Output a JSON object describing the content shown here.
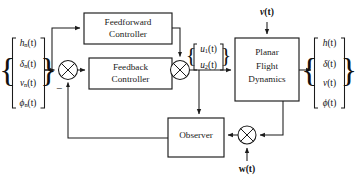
{
  "diagram": {
    "type": "control-system-block-diagram",
    "canvas": {
      "width": 357,
      "height": 180
    },
    "colors": {
      "background": "#ffffff",
      "line": "#1b1b1b",
      "text": "#111111",
      "block_fill": "#ffffff"
    },
    "blocks": [
      {
        "id": "feedforward-controller",
        "lines": [
          "Feedforward",
          "Controller"
        ],
        "x": 84,
        "y": 13,
        "w": 88,
        "h": 31
      },
      {
        "id": "feedback-controller",
        "lines": [
          "Feedback",
          "Controller"
        ],
        "x": 89,
        "y": 58,
        "w": 83,
        "h": 31
      },
      {
        "id": "planar-flight-dynamics",
        "lines": [
          "Planar",
          "Flight",
          "Dynamics"
        ],
        "x": 235,
        "y": 38,
        "w": 64,
        "h": 63
      },
      {
        "id": "observer",
        "lines": [
          "Observer"
        ],
        "x": 168,
        "y": 118,
        "w": 56,
        "h": 39
      }
    ],
    "junctions": [
      {
        "id": "error-sum",
        "cx": 68,
        "cy": 70,
        "r": 9.5
      },
      {
        "id": "control-sum",
        "cx": 180,
        "cy": 70,
        "r": 9.5
      },
      {
        "id": "measurement-sum",
        "cx": 247,
        "cy": 135,
        "r": 9.0
      }
    ],
    "vectors": [
      {
        "id": "reference-input-vector",
        "brace": "both",
        "x": 28,
        "y_top": 36,
        "y_bottom": 110,
        "items": [
          {
            "base": "h",
            "sub": "n",
            "arg": "(t)"
          },
          {
            "base": "δ",
            "sub": "n",
            "arg": "(t)"
          },
          {
            "base": "v",
            "sub": "n",
            "arg": "(t)"
          },
          {
            "base": "ϕ",
            "sub": "n",
            "arg": "(t)"
          }
        ]
      },
      {
        "id": "control-input-vector",
        "brace": "both",
        "x": 208,
        "y_top": 47,
        "y_bottom": 67,
        "items": [
          {
            "base": "u",
            "sub": "1",
            "arg": "(t)"
          },
          {
            "base": "u",
            "sub": "2",
            "arg": "(t)"
          }
        ]
      },
      {
        "id": "output-state-vector",
        "brace": "both",
        "x": 329,
        "y_top": 36,
        "y_bottom": 110,
        "items": [
          {
            "base": "h",
            "sub": "",
            "arg": "(t)"
          },
          {
            "base": "δ",
            "sub": "",
            "arg": "(t)"
          },
          {
            "base": "v",
            "sub": "",
            "arg": "(t)"
          },
          {
            "base": "ϕ",
            "sub": "",
            "arg": "(t)"
          }
        ]
      }
    ],
    "signals": [
      {
        "id": "process-disturbance",
        "base": "ν",
        "arg": "(t)",
        "x": 267,
        "y": 13,
        "bold": true
      },
      {
        "id": "measurement-noise",
        "base": "w",
        "arg": "(t)",
        "x": 247,
        "y": 170,
        "bold": true
      }
    ],
    "annotations": [
      {
        "id": "negative-feedback-sign",
        "text": "−",
        "x": 59,
        "y": 89
      }
    ],
    "connections": [
      {
        "id": "reference-to-feedforward",
        "from": "reference-input-vector",
        "to": "feedforward-controller"
      },
      {
        "id": "reference-to-error-sum",
        "from": "reference-input-vector",
        "to": "error-sum"
      },
      {
        "id": "error-sum-to-feedback",
        "from": "error-sum",
        "to": "feedback-controller"
      },
      {
        "id": "feedforward-to-control-sum",
        "from": "feedforward-controller",
        "to": "control-sum"
      },
      {
        "id": "feedback-to-control-sum",
        "from": "feedback-controller",
        "to": "control-sum"
      },
      {
        "id": "control-sum-to-plant",
        "from": "control-sum",
        "to": "planar-flight-dynamics"
      },
      {
        "id": "control-sum-to-observer",
        "from": "control-sum",
        "to": "observer"
      },
      {
        "id": "disturbance-to-plant",
        "from": "process-disturbance",
        "to": "planar-flight-dynamics"
      },
      {
        "id": "plant-to-output",
        "from": "planar-flight-dynamics",
        "to": "output-state-vector"
      },
      {
        "id": "plant-to-measurement-sum",
        "from": "planar-flight-dynamics",
        "to": "measurement-sum"
      },
      {
        "id": "noise-to-measurement-sum",
        "from": "measurement-noise",
        "to": "measurement-sum"
      },
      {
        "id": "measurement-sum-to-observer",
        "from": "measurement-sum",
        "to": "observer"
      },
      {
        "id": "observer-to-error-sum",
        "from": "observer",
        "to": "error-sum"
      }
    ]
  }
}
